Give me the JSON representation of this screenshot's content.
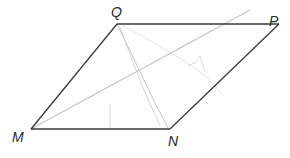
{
  "diagram": {
    "type": "parallelogram",
    "vertices": [
      {
        "name": "Q",
        "x": 117,
        "y": 24,
        "label_x": 111,
        "label_y": 5
      },
      {
        "name": "P",
        "x": 279,
        "y": 24,
        "label_x": 269,
        "label_y": 14
      },
      {
        "name": "M",
        "x": 31,
        "y": 129,
        "label_x": 12,
        "label_y": 130
      },
      {
        "name": "N",
        "x": 170,
        "y": 129,
        "label_x": 168,
        "label_y": 134
      }
    ],
    "edges": [
      {
        "from": "Q",
        "to": "P"
      },
      {
        "from": "P",
        "to": "N"
      },
      {
        "from": "N",
        "to": "M"
      },
      {
        "from": "M",
        "to": "Q"
      }
    ],
    "faint_lines": [
      {
        "description": "diagonal line from M extending beyond upper-right edge",
        "x1": 31,
        "y1": 129,
        "x2": 250,
        "y2": 10
      },
      {
        "description": "crease from Q toward N (outer)",
        "x1": 117,
        "y1": 24,
        "x2": 168,
        "y2": 128
      },
      {
        "description": "crease from Q toward N (inner)",
        "x1": 120,
        "y1": 26,
        "x2": 160,
        "y2": 125
      },
      {
        "description": "vertical tick mark",
        "x1": 110,
        "y1": 104,
        "x2": 110,
        "y2": 128
      }
    ],
    "colors": {
      "edge": "#3a3a3a",
      "faint": "#bdbdbd",
      "label": "#2a2a2a"
    }
  }
}
